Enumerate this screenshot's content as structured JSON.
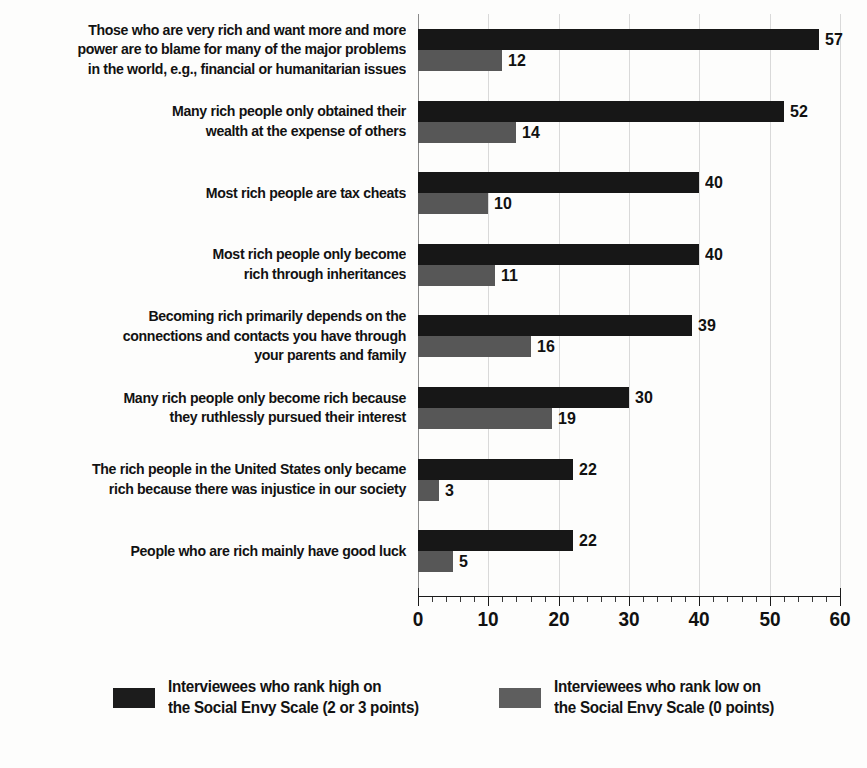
{
  "chart_data": {
    "type": "bar",
    "orientation": "horizontal",
    "title": "",
    "subtitle": "",
    "xlabel": "",
    "ylabel": "",
    "xlim": [
      0,
      60
    ],
    "xticks": [
      0,
      10,
      20,
      30,
      40,
      50,
      60
    ],
    "xtick_labels": [
      "0",
      "10",
      "20",
      "30",
      "40",
      "50",
      "60"
    ],
    "minor_tick_interval": 2,
    "grid": true,
    "grid_axis": "x",
    "legend_position": "bottom",
    "categories": [
      "Those who are very rich and want more and more\npower are to blame for many of the major problems\nin the world, e.g., financial or humanitarian issues",
      "Many rich people only obtained their\nwealth at the expense of others",
      "Most rich people are tax cheats",
      "Most rich people only become\nrich through inheritances",
      "Becoming rich primarily depends on the\nconnections and contacts you have through\nyour parents and family",
      "Many rich people only become rich because\nthey ruthlessly pursued their interest",
      "The rich people in the United States only became\nrich because there was injustice in our society",
      "People who are rich mainly have good luck"
    ],
    "series": [
      {
        "name": "Interviewees who rank high on the Social Envy Scale (2 or 3 points)",
        "color": "#171717",
        "values": [
          57,
          52,
          40,
          40,
          39,
          30,
          22,
          22
        ]
      },
      {
        "name": "Interviewees who rank low on the Social Envy Scale (0 points)",
        "color": "#575757",
        "values": [
          12,
          14,
          10,
          11,
          16,
          19,
          3,
          5
        ]
      }
    ],
    "data_labels": {
      "high": [
        "57",
        "52",
        "40",
        "40",
        "39",
        "30",
        "22",
        "22"
      ],
      "low": [
        "12",
        "14",
        "10",
        "11",
        "16",
        "19",
        "3",
        "5"
      ]
    }
  },
  "legend": {
    "entries": [
      {
        "label": "Interviewees who rank high on\nthe Social Envy Scale (2 or 3 points)",
        "swatch_color": "#1c1c1c"
      },
      {
        "label": "Interviewees who rank low on\nthe Social Envy Scale (0 points)",
        "swatch_color": "#5e5e5e"
      }
    ]
  }
}
